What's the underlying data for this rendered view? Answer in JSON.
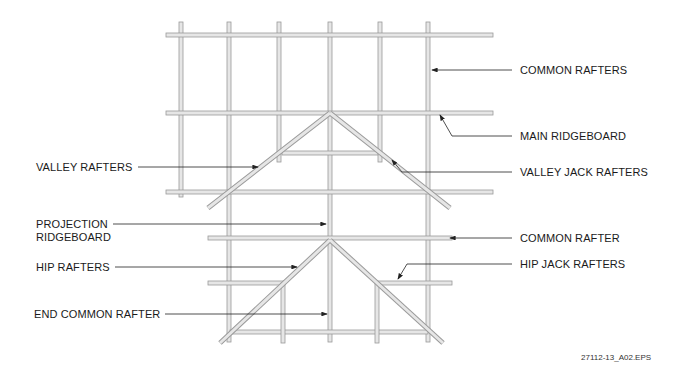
{
  "labels": {
    "common_rafters": "COMMON RAFTERS",
    "main_ridgeboard": "MAIN RIDGEBOARD",
    "valley_rafters": "VALLEY RAFTERS",
    "valley_jack_rafters": "VALLEY JACK RAFTERS",
    "projection_ridgeboard_1": "PROJECTION",
    "projection_ridgeboard_2": "RIDGEBOARD",
    "common_rafter": "COMMON RAFTER",
    "hip_rafters": "HIP RAFTERS",
    "hip_jack_rafters": "HIP JACK RAFTERS",
    "end_common_rafter": "END COMMON RAFTER"
  },
  "figure_id": "27112-13_A02.EPS",
  "colors": {
    "member_fill": "#e6e6e6",
    "member_edge": "#9a9a9a",
    "leader": "#222222"
  }
}
